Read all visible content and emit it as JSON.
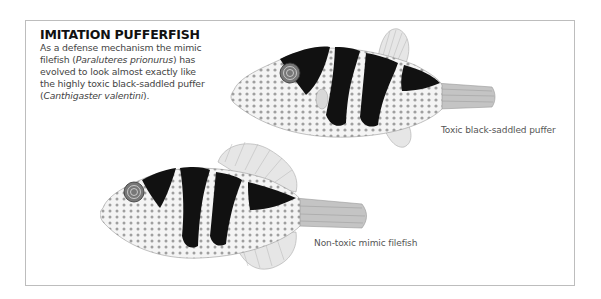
{
  "header": {
    "title": "IMITATION PUFFERFISH",
    "description": {
      "part1": "As a defense mechanism the mimic filefish (",
      "species1": "Paraluteres prionurus",
      "part2": ") has evolved to look almost exactly like the highly toxic black-saddled puffer (",
      "species2": "Canthigaster valentini",
      "part3": ")."
    }
  },
  "figures": [
    {
      "name": "toxic-puffer",
      "label": "Toxic black-saddled puffer"
    },
    {
      "name": "mimic-filefish",
      "label": "Non-toxic mimic filefish"
    }
  ],
  "colors": {
    "border": "#bdbdbd",
    "stripe": "#111111",
    "spots": "#8a8a8a",
    "fin": "#cfcfcf"
  }
}
